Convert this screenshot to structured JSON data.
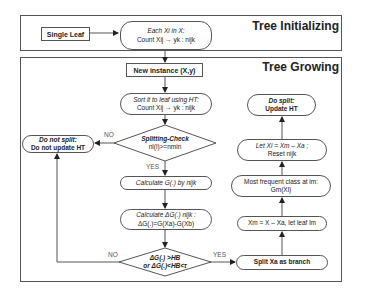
{
  "sections": {
    "init_title": "Tree Initializing",
    "grow_title": "Tree Growing"
  },
  "nodes": {
    "single_leaf": "Single Leaf",
    "each_xi": {
      "line1": "Each Xi in X:",
      "line2": "Count Xij → yk : nijk"
    },
    "new_instance": "New instance (X,y)",
    "sort_leaf": {
      "line1": "Sort it to leaf using HT:",
      "line2": "Count Xij → yk : nijk"
    },
    "splitting_check": {
      "line1": "Splitting-Check",
      "line2": "nl(l)>=nmin"
    },
    "do_not_split": {
      "line1": "Do not split:",
      "line2": "Do not update HT"
    },
    "calc_g": "Calculate G(.) by nijk",
    "calc_delta_g": {
      "line1": "Calculate ΔG(.) nijk :",
      "line2": "ΔG(.)=G(Xa)-G(Xb)"
    },
    "hb_check": {
      "line1": "ΔG(.) >HB",
      "line2": "or ΔG(.)<HB<τ"
    },
    "split_xa": "Split Xa as branch",
    "xm_assign": "Xm = X – Xa, let leaf lm",
    "most_frequent": {
      "line1": "Most frequent class at lm:",
      "line2": "Gm(Xl)"
    },
    "let_xi": {
      "line1": "Let Xi = Xm – Xa ;",
      "line2": "Reset nijk"
    },
    "do_split": {
      "line1": "Do split:",
      "line2": "Update HT"
    }
  },
  "edge_labels": {
    "no_split_check": "NO",
    "yes_split_check": "YES",
    "no_hb": "NO",
    "yes_hb": "YES"
  },
  "colors": {
    "stroke": "#555555",
    "text": "#222222",
    "background": "#ffffff"
  }
}
